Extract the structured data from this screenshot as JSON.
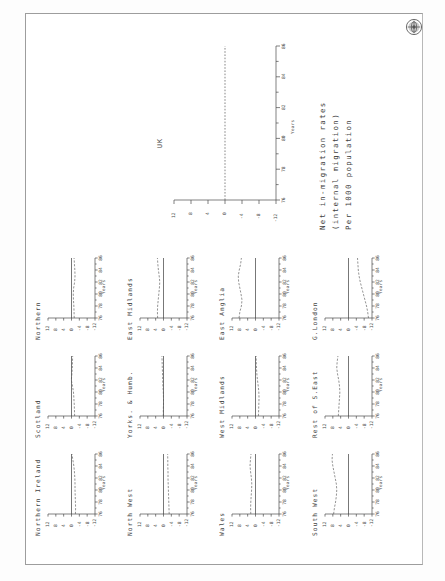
{
  "document": {
    "type": "scanned-figure-page",
    "orientation": "landscape-rotated-90",
    "emblem": "university-crest-seal"
  },
  "caption": {
    "line1": "Net in-migration rates",
    "line2": "(internal migration)",
    "line3": "Per 1000 population"
  },
  "axis": {
    "x_title": "Years",
    "x_ticks": [
      "76",
      "78",
      "80",
      "82",
      "84",
      "86"
    ],
    "y_ticks": [
      "12",
      "8",
      "4",
      "0",
      "-4",
      "-8",
      "-12"
    ]
  },
  "main_chart_label": "UK",
  "chart_data": [
    {
      "type": "line",
      "title": "UK",
      "xlabel": "Years",
      "ylabel": "Net in-migration rates (internal migration) Per 1000 population",
      "xlim": [
        76,
        86
      ],
      "ylim": [
        -12,
        12
      ],
      "x": [
        76,
        77,
        78,
        79,
        80,
        81,
        82,
        83,
        84,
        85,
        86
      ],
      "values": [
        0,
        0,
        0,
        0,
        0,
        0,
        0,
        0,
        0,
        0,
        0
      ],
      "grid": false,
      "note": "flat dashed zero reference line"
    },
    {
      "type": "line",
      "title": "Northern",
      "xlabel": "Years",
      "xlim": [
        76,
        86
      ],
      "ylim": [
        -12,
        12
      ],
      "x": [
        76,
        77,
        78,
        79,
        80,
        81,
        82,
        83,
        84,
        85,
        86
      ],
      "values": [
        -1.4,
        -1.3,
        -1.2,
        -1.0,
        -0.9,
        -1.1,
        -1.6,
        -1.8,
        -1.7,
        -1.5,
        -1.3
      ]
    },
    {
      "type": "line",
      "title": "Scotland",
      "xlabel": "Years",
      "xlim": [
        76,
        86
      ],
      "ylim": [
        -12,
        12
      ],
      "x": [
        76,
        77,
        78,
        79,
        80,
        81,
        82,
        83,
        84,
        85,
        86
      ],
      "values": [
        -1.6,
        -1.5,
        -1.4,
        -1.2,
        -1.0,
        -0.5,
        0.1,
        -0.2,
        -0.4,
        -0.5,
        -0.6
      ]
    },
    {
      "type": "line",
      "title": "Northern Ireland",
      "xlabel": "Years",
      "xlim": [
        76,
        86
      ],
      "ylim": [
        -12,
        12
      ],
      "x": [
        76,
        77,
        78,
        79,
        80,
        81,
        82,
        83,
        84,
        85,
        86
      ],
      "values": [
        -2.0,
        -2.1,
        -2.0,
        -1.9,
        -1.8,
        -1.8,
        -1.7,
        -1.5,
        -1.2,
        -0.7,
        -0.2
      ]
    },
    {
      "type": "line",
      "title": "East Midlands",
      "xlabel": "Years",
      "xlim": [
        76,
        86
      ],
      "ylim": [
        -12,
        12
      ],
      "x": [
        76,
        77,
        78,
        79,
        80,
        81,
        82,
        83,
        84,
        85,
        86
      ],
      "values": [
        3.0,
        3.1,
        3.0,
        2.7,
        2.4,
        2.1,
        1.9,
        2.2,
        2.6,
        2.9,
        3.1
      ]
    },
    {
      "type": "line",
      "title": "Yorks. & Humb.",
      "xlabel": "Years",
      "xlim": [
        76,
        86
      ],
      "ylim": [
        -12,
        12
      ],
      "x": [
        76,
        77,
        78,
        79,
        80,
        81,
        82,
        83,
        84,
        85,
        86
      ],
      "values": [
        0.1,
        0.1,
        0.0,
        0.0,
        0.1,
        0.3,
        0.4,
        0.5,
        0.6,
        0.7,
        0.8
      ]
    },
    {
      "type": "line",
      "title": "North West",
      "xlabel": "Years",
      "xlim": [
        76,
        86
      ],
      "ylim": [
        -12,
        12
      ],
      "x": [
        76,
        77,
        78,
        79,
        80,
        81,
        82,
        83,
        84,
        85,
        86
      ],
      "values": [
        -2.9,
        -2.8,
        -2.7,
        -2.6,
        -2.5,
        -2.4,
        -2.3,
        -2.3,
        -2.2,
        -2.2,
        -2.1
      ]
    },
    {
      "type": "line",
      "title": "East Anglia",
      "xlabel": "Years",
      "xlim": [
        76,
        86
      ],
      "ylim": [
        -12,
        12
      ],
      "x": [
        76,
        77,
        78,
        79,
        80,
        81,
        82,
        83,
        84,
        85,
        86
      ],
      "values": [
        8.4,
        8.0,
        7.2,
        6.9,
        7.4,
        8.0,
        8.6,
        8.8,
        8.3,
        7.6,
        7.2
      ]
    },
    {
      "type": "line",
      "title": "West Midlands",
      "xlabel": "Years",
      "xlim": [
        76,
        86
      ],
      "ylim": [
        -12,
        12
      ],
      "x": [
        76,
        77,
        78,
        79,
        80,
        81,
        82,
        83,
        84,
        85,
        86
      ],
      "values": [
        -1.5,
        -1.6,
        -1.7,
        -1.8,
        -1.7,
        -1.4,
        -1.0,
        -0.7,
        -0.5,
        -0.4,
        -0.3
      ]
    },
    {
      "type": "line",
      "title": "Wales",
      "xlabel": "Years",
      "xlim": [
        76,
        86
      ],
      "ylim": [
        -12,
        12
      ],
      "x": [
        76,
        77,
        78,
        79,
        80,
        81,
        82,
        83,
        84,
        85,
        86
      ],
      "values": [
        2.4,
        2.5,
        2.4,
        2.2,
        2.0,
        1.9,
        2.1,
        2.5,
        2.8,
        2.6,
        2.3
      ]
    },
    {
      "type": "line",
      "title": "G.London",
      "xlabel": "Years",
      "xlim": [
        76,
        86
      ],
      "ylim": [
        -12,
        12
      ],
      "x": [
        76,
        77,
        78,
        79,
        80,
        81,
        82,
        83,
        84,
        85,
        86
      ],
      "values": [
        -10.2,
        -9.8,
        -9.2,
        -8.4,
        -7.6,
        -6.8,
        -6.0,
        -5.4,
        -5.0,
        -4.8,
        -4.6
      ]
    },
    {
      "type": "line",
      "title": "Rest of S.East",
      "xlabel": "Years",
      "xlim": [
        76,
        86
      ],
      "ylim": [
        -12,
        12
      ],
      "x": [
        76,
        77,
        78,
        79,
        80,
        81,
        82,
        83,
        84,
        85,
        86
      ],
      "values": [
        5.2,
        5.0,
        4.8,
        4.6,
        4.4,
        4.6,
        5.0,
        5.6,
        6.0,
        5.8,
        5.4
      ]
    },
    {
      "type": "line",
      "title": "South West",
      "xlabel": "Years",
      "xlim": [
        76,
        86
      ],
      "ylim": [
        -12,
        12
      ],
      "x": [
        76,
        77,
        78,
        79,
        80,
        81,
        82,
        83,
        84,
        85,
        86
      ],
      "values": [
        7.6,
        7.2,
        6.6,
        6.2,
        6.0,
        6.2,
        6.8,
        7.4,
        8.0,
        8.4,
        8.2
      ]
    }
  ],
  "grid_layout": {
    "columns": 3,
    "rows": 4,
    "order": [
      "Northern",
      "Scotland",
      "Northern Ireland",
      "East Midlands",
      "Yorks. & Humb.",
      "North West",
      "East Anglia",
      "West Midlands",
      "Wales",
      "G.London",
      "Rest of S.East",
      "South West"
    ]
  }
}
